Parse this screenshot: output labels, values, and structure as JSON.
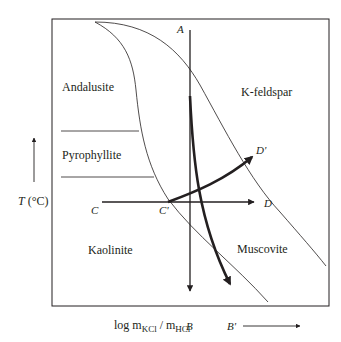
{
  "diagram": {
    "fields": [
      "Andalusite",
      "Pyrophyllite",
      "K-feldspar",
      "Kaolinite",
      "Muscovite"
    ],
    "field_labels": {
      "andalusite": "Andalusite",
      "pyrophyllite": "Pyrophyllite",
      "kfeldspar": "K-feldspar",
      "kaolinite": "Kaolinite",
      "muscovite": "Muscovite"
    },
    "path_labels": {
      "A": "A",
      "B": "B",
      "B_prime": "B'",
      "C": "C",
      "C_prime": "C'",
      "D": "D",
      "D_prime": "D'"
    },
    "axes": {
      "y_label_var": "T",
      "y_label_unit": "(°C)",
      "x_label_prefix": "log m",
      "x_label_sub1": "KCl",
      "x_label_mid": " / m",
      "x_label_sub2": "HCl"
    },
    "colors": {
      "line": "#231f20",
      "background": "#ffffff"
    }
  }
}
